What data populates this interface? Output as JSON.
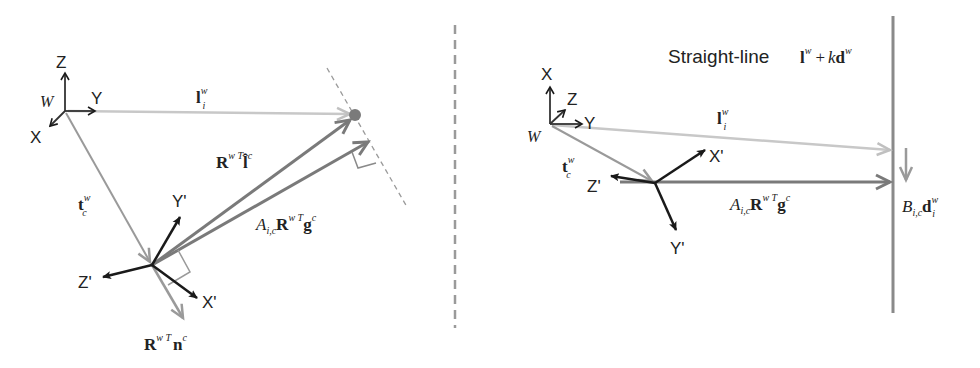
{
  "colors": {
    "light_vector": "#c8c8c8",
    "mid_vector": "#9a9a9a",
    "dark_vector": "#7a7a7a",
    "axis": "#1a1a1a",
    "divider": "#9a9a9a",
    "line": "#8a8a8a"
  },
  "left": {
    "world_axes": {
      "origin": "W",
      "x": "X",
      "y": "Y",
      "z": "Z"
    },
    "camera_axes": {
      "x": "X'",
      "y": "Y'",
      "z": "Z'"
    },
    "vectors": {
      "l": {
        "base": "l",
        "sub": "i",
        "sup": "w"
      },
      "t": {
        "base": "t",
        "sub": "c",
        "sup": "w"
      },
      "rl": {
        "base": "R",
        "sub": "c",
        "sup": "w T",
        "vec": "l̂",
        "vsub": "i",
        "vsup": "c"
      },
      "ag": {
        "coef": "A",
        "csub": "i,c",
        "base": "R",
        "sub": "c",
        "sup": "w T",
        "vec": "g",
        "vsub": "i",
        "vsup": "c"
      },
      "rn": {
        "base": "R",
        "sub": "c",
        "sup": "w T",
        "vec": "n",
        "vsub": "i",
        "vsup": "c"
      }
    }
  },
  "right": {
    "title": "Straight-line",
    "line_eq": {
      "l": "l",
      "lsup": "w",
      "plus": "+",
      "k": "k",
      "d": "d",
      "dsup": "w"
    },
    "world_axes": {
      "origin": "W",
      "x": "X",
      "y": "Y",
      "z": "Z"
    },
    "camera_axes": {
      "x": "X'",
      "y": "Y'",
      "z": "Z'"
    },
    "vectors": {
      "l": {
        "base": "l",
        "sub": "i",
        "sup": "w"
      },
      "t": {
        "base": "t",
        "sub": "c",
        "sup": "w"
      },
      "ag": {
        "coef": "A",
        "csub": "i,c",
        "base": "R",
        "sub": "c",
        "sup": "w T",
        "vec": "g",
        "vsub": "i",
        "vsup": "c"
      },
      "bd": {
        "coef": "B",
        "csub": "i,c",
        "vec": "d",
        "vsub": "i",
        "vsup": "w"
      }
    }
  }
}
